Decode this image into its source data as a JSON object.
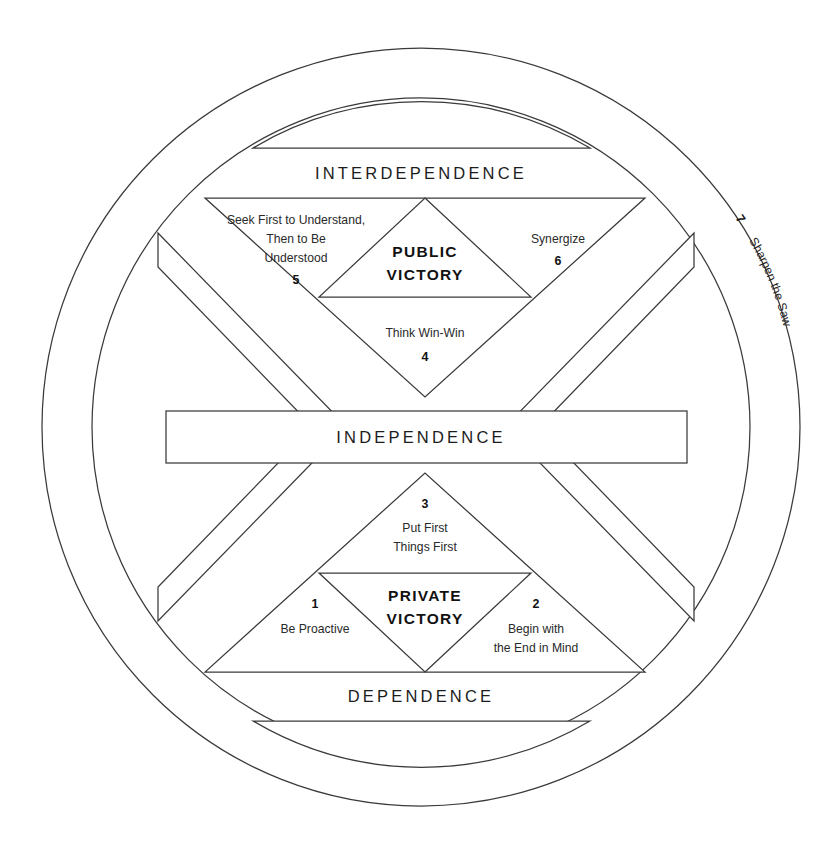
{
  "diagram": {
    "canvas": {
      "width": 840,
      "height": 851
    },
    "line_color": "#3a3a3a",
    "text_color": "#1c1c1c",
    "background": "#ffffff"
  },
  "tiers": {
    "interdependence": "INTERDEPENDENCE",
    "independence": "INDEPENDENCE",
    "dependence": "DEPENDENCE"
  },
  "victories": {
    "public_line1": "PUBLIC",
    "public_line2": "VICTORY",
    "private_line1": "PRIVATE",
    "private_line2": "VICTORY"
  },
  "habits": [
    {
      "number": "1",
      "name": "Be Proactive",
      "lines": [
        "Be Proactive"
      ],
      "group": "private-victory",
      "position": "bottom-left"
    },
    {
      "number": "2",
      "name": "Begin with the End in Mind",
      "lines": [
        "Begin with",
        "the End in Mind"
      ],
      "group": "private-victory",
      "position": "bottom-right"
    },
    {
      "number": "3",
      "name": "Put First Things First",
      "lines": [
        "Put First",
        "Things First"
      ],
      "group": "private-victory",
      "position": "bottom-center"
    },
    {
      "number": "4",
      "name": "Think Win-Win",
      "lines": [
        "Think Win-Win"
      ],
      "group": "public-victory",
      "position": "top-center-lower"
    },
    {
      "number": "5",
      "name": "Seek First to Understand, Then to Be Understood",
      "lines": [
        "Seek First to Understand,",
        "Then to Be",
        "Understood"
      ],
      "group": "public-victory",
      "position": "top-left"
    },
    {
      "number": "6",
      "name": "Synergize",
      "lines": [
        "Synergize"
      ],
      "group": "public-victory",
      "position": "top-right"
    },
    {
      "number": "7",
      "name": "Sharpen the Saw",
      "lines": [
        "Sharpen the Saw"
      ],
      "group": "renewal-ring",
      "position": "right-arc"
    }
  ]
}
